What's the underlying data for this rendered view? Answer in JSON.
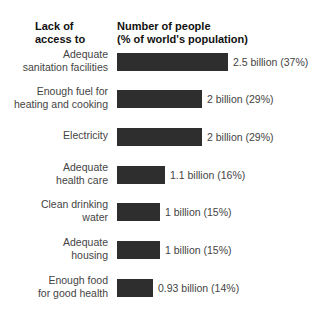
{
  "header": {
    "left_line1": "Lack of",
    "left_line2": "access to",
    "right_line1": "Number of people",
    "right_line2": "(% of world's population)"
  },
  "colors": {
    "bar": "#2e2e2e",
    "text": "#444444",
    "header": "#111111"
  },
  "rows": [
    {
      "label1": "Adequate",
      "label2": "sanitation facilities",
      "value_label": "2.5 billion (37%)",
      "bar_px": 111,
      "top": 48
    },
    {
      "label1": "Enough fuel for",
      "label2": "heating and cooking",
      "value_label": "2 billion (29%)",
      "bar_px": 85,
      "top": 85
    },
    {
      "label1": "",
      "label2": "Electricity",
      "value_label": "2 billion (29%)",
      "bar_px": 85,
      "top": 123
    },
    {
      "label1": "Adequate",
      "label2": "health care",
      "value_label": "1.1 billion (16%)",
      "bar_px": 48,
      "top": 161
    },
    {
      "label1": "Clean drinking",
      "label2": "water",
      "value_label": "1 billion (15%)",
      "bar_px": 43,
      "top": 198
    },
    {
      "label1": "Adequate",
      "label2": "housing",
      "value_label": "1 billion (15%)",
      "bar_px": 43,
      "top": 236
    },
    {
      "label1": "Enough food",
      "label2": "for good health",
      "value_label": "0.93 billion (14%)",
      "bar_px": 36,
      "top": 274
    }
  ],
  "chart_data": {
    "type": "bar",
    "orientation": "horizontal",
    "title": "",
    "xlabel": "Number of people (% of world's population)",
    "ylabel": "Lack of access to",
    "categories": [
      "Adequate sanitation facilities",
      "Enough fuel for heating and cooking",
      "Electricity",
      "Adequate health care",
      "Clean drinking water",
      "Adequate housing",
      "Enough food for good health"
    ],
    "series": [
      {
        "name": "People (billions)",
        "values": [
          2.5,
          2,
          2,
          1.1,
          1,
          1,
          0.93
        ]
      },
      {
        "name": "% of world's population",
        "values": [
          37,
          29,
          29,
          16,
          15,
          15,
          14
        ]
      }
    ],
    "data_labels": [
      "2.5 billion (37%)",
      "2 billion (29%)",
      "2 billion (29%)",
      "1.1 billion (16%)",
      "1 billion (15%)",
      "1 billion (15%)",
      "0.93 billion (14%)"
    ],
    "grid": false,
    "legend": "none"
  }
}
